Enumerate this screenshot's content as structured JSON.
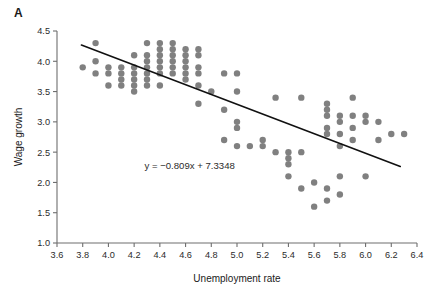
{
  "panel": {
    "label": "A"
  },
  "chart_data": {
    "type": "scatter",
    "title": "",
    "xlabel": "Unemployment rate",
    "ylabel": "Wage growth",
    "xlim": [
      3.6,
      6.4
    ],
    "ylim": [
      1.0,
      4.5
    ],
    "xticks": [
      "3.6",
      "3.8",
      "4.0",
      "4.2",
      "4.4",
      "4.6",
      "4.8",
      "5.0",
      "5.2",
      "5.4",
      "5.6",
      "5.8",
      "6.0",
      "6.2",
      "6.4"
    ],
    "xtick_values": [
      3.6,
      3.8,
      4.0,
      4.2,
      4.4,
      4.6,
      4.8,
      5.0,
      5.2,
      5.4,
      5.6,
      5.8,
      6.0,
      6.2,
      6.4
    ],
    "yticks": [
      "1.0",
      "1.5",
      "2.0",
      "2.5",
      "3.0",
      "3.5",
      "4.0",
      "4.5"
    ],
    "ytick_values": [
      1.0,
      1.5,
      2.0,
      2.5,
      3.0,
      3.5,
      4.0,
      4.5
    ],
    "grid": false,
    "legend": null,
    "marker_color": "#808080",
    "marker_size": 3.2,
    "line_color": "#111111",
    "annotation": "y = −0.809x + 7.3348",
    "annotation_x": 4.28,
    "annotation_y": 2.22,
    "trendline": {
      "slope": -0.809,
      "intercept": 7.3348,
      "x_start": 3.79,
      "x_end": 6.27
    },
    "points": [
      [
        3.8,
        3.9
      ],
      [
        3.9,
        4.3
      ],
      [
        3.9,
        4.0
      ],
      [
        3.9,
        3.8
      ],
      [
        4.0,
        3.9
      ],
      [
        4.0,
        3.8
      ],
      [
        4.0,
        3.6
      ],
      [
        4.1,
        3.9
      ],
      [
        4.1,
        3.8
      ],
      [
        4.1,
        3.7
      ],
      [
        4.1,
        3.6
      ],
      [
        4.2,
        4.1
      ],
      [
        4.2,
        3.9
      ],
      [
        4.2,
        3.8
      ],
      [
        4.2,
        3.7
      ],
      [
        4.2,
        3.6
      ],
      [
        4.2,
        3.5
      ],
      [
        4.3,
        4.3
      ],
      [
        4.3,
        4.1
      ],
      [
        4.3,
        4.0
      ],
      [
        4.3,
        3.9
      ],
      [
        4.3,
        3.8
      ],
      [
        4.3,
        3.7
      ],
      [
        4.3,
        3.6
      ],
      [
        4.4,
        4.3
      ],
      [
        4.4,
        4.2
      ],
      [
        4.4,
        4.1
      ],
      [
        4.4,
        4.0
      ],
      [
        4.4,
        3.9
      ],
      [
        4.4,
        3.8
      ],
      [
        4.4,
        3.6
      ],
      [
        4.5,
        4.3
      ],
      [
        4.5,
        4.2
      ],
      [
        4.5,
        4.1
      ],
      [
        4.5,
        4.0
      ],
      [
        4.5,
        3.9
      ],
      [
        4.5,
        3.8
      ],
      [
        4.6,
        4.2
      ],
      [
        4.6,
        4.1
      ],
      [
        4.6,
        4.0
      ],
      [
        4.6,
        3.9
      ],
      [
        4.6,
        3.8
      ],
      [
        4.6,
        3.7
      ],
      [
        4.7,
        4.2
      ],
      [
        4.7,
        4.1
      ],
      [
        4.7,
        3.9
      ],
      [
        4.7,
        3.8
      ],
      [
        4.7,
        3.6
      ],
      [
        4.7,
        3.3
      ],
      [
        4.8,
        3.5
      ],
      [
        4.9,
        3.8
      ],
      [
        4.9,
        3.2
      ],
      [
        4.9,
        2.7
      ],
      [
        5.0,
        3.8
      ],
      [
        5.0,
        3.5
      ],
      [
        5.0,
        3.0
      ],
      [
        5.0,
        2.9
      ],
      [
        5.0,
        2.6
      ],
      [
        5.1,
        2.6
      ],
      [
        5.2,
        2.7
      ],
      [
        5.2,
        2.6
      ],
      [
        5.3,
        3.4
      ],
      [
        5.3,
        2.5
      ],
      [
        5.4,
        2.5
      ],
      [
        5.4,
        2.4
      ],
      [
        5.4,
        2.3
      ],
      [
        5.4,
        2.1
      ],
      [
        5.5,
        3.4
      ],
      [
        5.5,
        2.5
      ],
      [
        5.5,
        1.9
      ],
      [
        5.6,
        2.0
      ],
      [
        5.6,
        1.6
      ],
      [
        5.7,
        3.3
      ],
      [
        5.7,
        3.2
      ],
      [
        5.7,
        3.1
      ],
      [
        5.7,
        2.9
      ],
      [
        5.7,
        2.8
      ],
      [
        5.7,
        1.9
      ],
      [
        5.7,
        1.7
      ],
      [
        5.8,
        3.1
      ],
      [
        5.8,
        3.0
      ],
      [
        5.8,
        2.8
      ],
      [
        5.8,
        2.6
      ],
      [
        5.8,
        2.1
      ],
      [
        5.8,
        1.8
      ],
      [
        5.9,
        3.4
      ],
      [
        5.9,
        3.1
      ],
      [
        5.9,
        2.9
      ],
      [
        5.9,
        2.7
      ],
      [
        6.0,
        3.1
      ],
      [
        6.0,
        3.0
      ],
      [
        6.0,
        2.1
      ],
      [
        6.1,
        3.0
      ],
      [
        6.1,
        2.7
      ],
      [
        6.2,
        2.8
      ],
      [
        6.3,
        2.8
      ]
    ]
  }
}
